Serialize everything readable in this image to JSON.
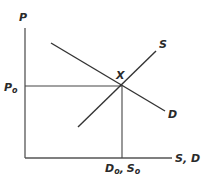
{
  "diagram": {
    "type": "supply-demand",
    "axes": {
      "y_label": "P",
      "x_label": "S, D"
    },
    "curves": {
      "supply_label": "S",
      "demand_label": "D"
    },
    "equilibrium": {
      "point_label": "X",
      "price_label_main": "P",
      "price_label_sub": "o",
      "quantity_label_d_main": "D",
      "quantity_label_d_sub": "o",
      "quantity_label_sep": ",",
      "quantity_label_s_main": "S",
      "quantity_label_s_sub": "o"
    },
    "colors": {
      "line": "#333333",
      "axis": "#555555",
      "text": "#2a2a2a",
      "background": "#ffffff"
    }
  }
}
